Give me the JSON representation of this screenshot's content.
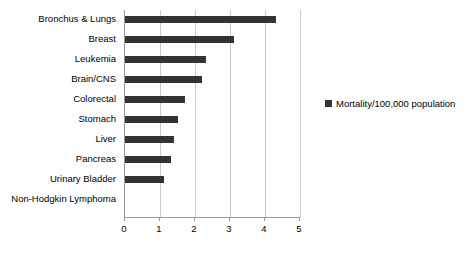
{
  "chart_data": {
    "type": "bar",
    "orientation": "horizontal",
    "title": "",
    "xlabel": "",
    "ylabel": "",
    "categories": [
      "Bronchus & Lungs",
      "Breast",
      "Leukemia",
      "Brain/CNS",
      "Colorectal",
      "Stomach",
      "Liver",
      "Pancreas",
      "Urinary Bladder",
      "Non-Hodgkin Lymphoma"
    ],
    "series": [
      {
        "name": "Mortality/100,000 population",
        "color": "#333333",
        "values": [
          4.3,
          3.1,
          2.3,
          2.2,
          1.7,
          1.5,
          1.4,
          1.3,
          1.1,
          0
        ]
      }
    ],
    "xlim": [
      0,
      5
    ],
    "xticks": [
      0,
      1,
      2,
      3,
      4,
      5
    ],
    "xtick_labels": [
      "0",
      "1",
      "2",
      "3",
      "4",
      "5"
    ],
    "grid": true,
    "legend": {
      "position": "right",
      "entries": [
        {
          "label": "Mortality/100,000 population",
          "color": "#333333",
          "marker": "square-marker"
        }
      ]
    }
  }
}
